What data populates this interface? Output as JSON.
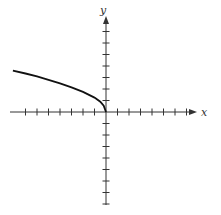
{
  "chart_data": {
    "type": "line",
    "title": "",
    "xlabel": "x",
    "ylabel": "y",
    "grid": false,
    "x_ticks": [
      -7,
      -6,
      -5,
      -4,
      -3,
      -2,
      -1,
      1,
      2,
      3,
      4,
      5,
      6,
      7
    ],
    "y_ticks": [
      -8,
      -7,
      -6,
      -5,
      -4,
      -3,
      -2,
      -1,
      1,
      2,
      3,
      4,
      5,
      6,
      7,
      8
    ],
    "xlim": [
      -8.1,
      8
    ],
    "ylim": [
      -8,
      8.3
    ],
    "series": [
      {
        "name": "curve",
        "x": [
          -8.1,
          -7,
          -6,
          -5,
          -4,
          -3,
          -2,
          -1,
          -0.5,
          -0.2,
          0
        ],
        "y": [
          3.6,
          3.35,
          3.1,
          2.8,
          2.5,
          2.15,
          1.75,
          1.25,
          0.9,
          0.55,
          0
        ]
      }
    ],
    "colors": {
      "axis": "#333333",
      "curve": "#111111"
    }
  },
  "labels": {
    "x_axis": "x",
    "y_axis": "y"
  }
}
